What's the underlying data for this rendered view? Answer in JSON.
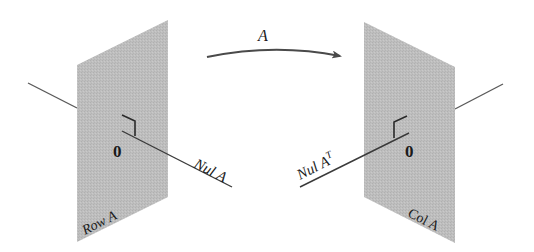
{
  "figure": {
    "arrow_label": "A",
    "left": {
      "plane_label": "Row A",
      "line_label": "Nul A",
      "origin_label": "0"
    },
    "right": {
      "plane_label": "Col A",
      "line_label_base": "Nul A",
      "line_label_sup": "T",
      "origin_label": "0"
    }
  },
  "colors": {
    "plane_fill": "#bdbdbd",
    "line": "#4a4a4a",
    "text": "#1a1a1a",
    "background": "#ffffff"
  }
}
